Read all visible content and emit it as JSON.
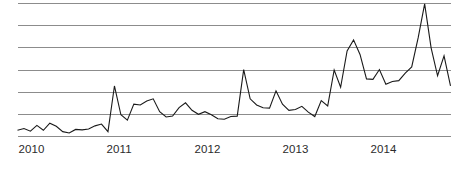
{
  "chart_data": {
    "type": "line",
    "title": "",
    "subtitle": "",
    "xlabel": "",
    "ylabel": "",
    "legend": [],
    "legend_position": "none",
    "grid": true,
    "grid_lines_y": [
      0,
      1,
      2,
      3,
      4,
      5,
      6
    ],
    "xlim": [
      2010.0,
      2014.92
    ],
    "ylim": [
      0,
      6
    ],
    "x_tick_labels": [
      "2010",
      "2011",
      "2012",
      "2013",
      "2014"
    ],
    "x_tick_values": [
      2010,
      2011,
      2012,
      2013,
      2014
    ],
    "y_tick_labels": [],
    "annotations": [],
    "series": [
      {
        "name": "series-1",
        "color": "#1a1a1a",
        "x": [
          2010.0,
          2010.083,
          2010.167,
          2010.25,
          2010.333,
          2010.417,
          2010.5,
          2010.583,
          2010.667,
          2010.75,
          2010.833,
          2010.917,
          2011.0,
          2011.083,
          2011.167,
          2011.25,
          2011.333,
          2011.417,
          2011.5,
          2011.583,
          2011.667,
          2011.75,
          2011.833,
          2011.917,
          2012.0,
          2012.083,
          2012.167,
          2012.25,
          2012.333,
          2012.417,
          2012.5,
          2012.583,
          2012.667,
          2012.75,
          2012.833,
          2012.917,
          2013.0,
          2013.083,
          2013.167,
          2013.25,
          2013.333,
          2013.417,
          2013.5,
          2013.583,
          2013.667,
          2013.75,
          2013.833,
          2013.917,
          2014.0,
          2014.083,
          2014.167,
          2014.25,
          2014.333,
          2014.417,
          2014.5,
          2014.583,
          2014.667,
          2014.75,
          2014.833,
          2014.917
        ],
        "values": [
          0.28,
          0.36,
          0.24,
          0.5,
          0.28,
          0.6,
          0.46,
          0.22,
          0.16,
          0.32,
          0.3,
          0.34,
          0.48,
          0.56,
          0.22,
          2.28,
          0.98,
          0.74,
          1.46,
          1.42,
          1.6,
          1.7,
          1.12,
          0.88,
          0.92,
          1.3,
          1.52,
          1.18,
          1.0,
          1.12,
          0.98,
          0.8,
          0.78,
          0.9,
          0.92,
          3.02,
          1.7,
          1.42,
          1.3,
          1.28,
          2.06,
          1.46,
          1.18,
          1.22,
          1.36,
          1.1,
          0.9,
          1.62,
          1.38,
          3.0,
          2.22,
          3.86,
          4.36,
          3.7,
          2.6,
          2.58,
          3.02,
          2.36,
          2.48,
          2.52
        ],
        "values_continued": [
          2.86,
          3.14,
          4.46,
          5.98,
          4.0,
          2.74,
          3.64,
          2.28
        ]
      }
    ]
  }
}
